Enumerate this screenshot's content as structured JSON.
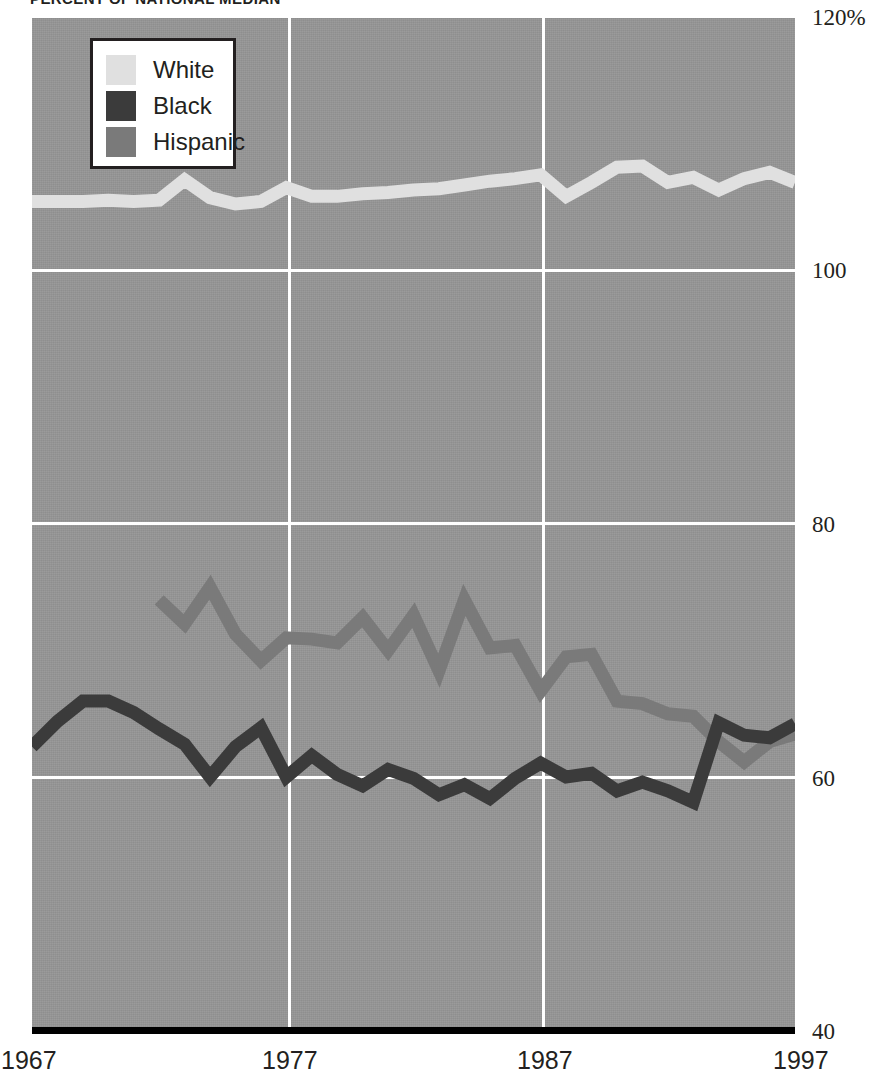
{
  "title": "PERCENT OF NATIONAL MEDIAN",
  "legend": {
    "items": [
      {
        "label": "White",
        "color": "#e0e0e0",
        "swatch_name": "legend-swatch-white"
      },
      {
        "label": "Black",
        "color": "#3b3b3b",
        "swatch_name": "legend-swatch-black"
      },
      {
        "label": "Hispanic",
        "color": "#7a7a7a",
        "swatch_name": "legend-swatch-hispanic"
      }
    ]
  },
  "axes": {
    "y_ticks": [
      "120%",
      "100",
      "80",
      "60",
      "40"
    ],
    "y_tick_values": [
      120,
      100,
      80,
      60,
      40
    ],
    "x_ticks": [
      "1967",
      "1977",
      "1987",
      "1997"
    ],
    "x_tick_values": [
      1967,
      1977,
      1987,
      1997
    ]
  },
  "colors": {
    "plot_background": "#949494",
    "gridline": "#ffffff",
    "baseline": "#000000",
    "white_series": "#e0e0e0",
    "black_series": "#3b3b3b",
    "hispanic_series": "#7a7a7a",
    "text": "#231f20"
  },
  "chart_data": {
    "type": "line",
    "title": "PERCENT OF NATIONAL MEDIAN",
    "xlabel": "",
    "ylabel": "Percent of national median",
    "xlim": [
      1967,
      1997
    ],
    "ylim": [
      40,
      120
    ],
    "grid": true,
    "legend_position": "top-left",
    "x_tick_labels": [
      "1967",
      "1977",
      "1987",
      "1997"
    ],
    "y_tick_labels": [
      "40",
      "60",
      "80",
      "100",
      "120%"
    ],
    "series": [
      {
        "name": "White",
        "color": "#e0e0e0",
        "x": [
          1967,
          1968,
          1969,
          1970,
          1971,
          1972,
          1973,
          1974,
          1975,
          1976,
          1977,
          1978,
          1979,
          1980,
          1981,
          1982,
          1983,
          1984,
          1985,
          1986,
          1987,
          1988,
          1989,
          1990,
          1991,
          1992,
          1993,
          1994,
          1995,
          1996,
          1997
        ],
        "values": [
          105.5,
          105.5,
          105.5,
          105.6,
          105.5,
          105.6,
          107.2,
          105.8,
          105.3,
          105.5,
          106.6,
          105.9,
          105.9,
          106.1,
          106.2,
          106.4,
          106.5,
          106.8,
          107.1,
          107.3,
          107.6,
          105.9,
          107.0,
          108.2,
          108.3,
          107.0,
          107.4,
          106.4,
          107.3,
          107.8,
          107.0
        ]
      },
      {
        "name": "Black",
        "color": "#3b3b3b",
        "x": [
          1967,
          1968,
          1969,
          1970,
          1971,
          1972,
          1973,
          1974,
          1975,
          1976,
          1977,
          1978,
          1979,
          1980,
          1981,
          1982,
          1983,
          1984,
          1985,
          1986,
          1987,
          1988,
          1989,
          1990,
          1991,
          1992,
          1993,
          1994,
          1995,
          1996,
          1997
        ],
        "values": [
          62.4,
          64.4,
          66.0,
          66.0,
          65.1,
          63.8,
          62.6,
          60.0,
          62.4,
          63.9,
          60.0,
          61.7,
          60.2,
          59.3,
          60.6,
          59.9,
          58.6,
          59.4,
          58.3,
          59.9,
          61.1,
          60.0,
          60.3,
          58.9,
          59.6,
          58.9,
          58.0,
          64.3,
          63.3,
          63.1,
          64.2
        ]
      },
      {
        "name": "Hispanic",
        "color": "#7a7a7a",
        "x": [
          1972,
          1973,
          1974,
          1975,
          1976,
          1977,
          1978,
          1979,
          1980,
          1981,
          1982,
          1983,
          1984,
          1985,
          1986,
          1987,
          1988,
          1989,
          1990,
          1991,
          1992,
          1993,
          1994,
          1995,
          1996,
          1997
        ],
        "values": [
          74.0,
          72.1,
          75.0,
          71.3,
          69.2,
          71.0,
          70.9,
          70.6,
          72.6,
          70.0,
          72.8,
          68.4,
          74.0,
          70.2,
          70.4,
          66.8,
          69.5,
          69.7,
          66.0,
          65.8,
          65.0,
          64.8,
          62.8,
          61.2,
          62.8,
          63.4
        ]
      }
    ]
  }
}
